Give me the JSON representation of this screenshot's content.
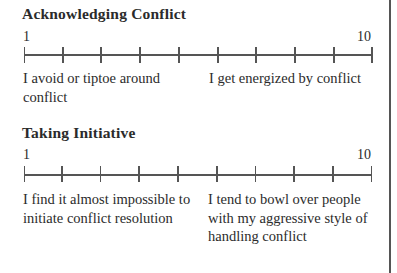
{
  "sections": [
    {
      "heading": "Acknowledging Conflict",
      "scale": {
        "min_label": "1",
        "max_label": "10",
        "ticks": 10
      },
      "low_description": "I avoid or tiptoe around conflict",
      "high_description": "I get energized by conflict"
    },
    {
      "heading": "Taking Initiative",
      "scale": {
        "min_label": "1",
        "max_label": "10",
        "ticks": 10
      },
      "low_description": "I find it almost impossible to initiate conflict resolution",
      "high_description": "I tend to bowl over people with my aggressive style of handling conflict"
    }
  ],
  "colors": {
    "text": "#2b2b2b",
    "lines": "#555555",
    "border": "#555555"
  }
}
